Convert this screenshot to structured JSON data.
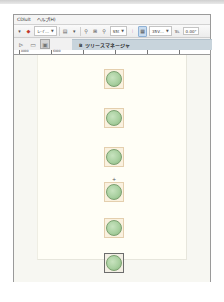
{
  "menubar": {
    "items": [
      {
        "label": "CDlult"
      },
      {
        "label": "ヘルプ(H)"
      }
    ]
  },
  "toolbar": {
    "layer_dropdown": "レイ…",
    "zoom_dropdown": "S5t",
    "size_dropdown": "35V…",
    "value_field": "0.00°"
  },
  "tabstrip": {
    "tab_label": "ツリースマネージャ",
    "tab_icon_glyph": "B"
  },
  "ruler": {
    "ticks": [
      "8000",
      "6000",
      "10000"
    ]
  },
  "canvas": {
    "nodes": [
      {
        "id": "node-1",
        "selected": false
      },
      {
        "id": "node-2",
        "selected": false
      },
      {
        "id": "node-3",
        "selected": false
      },
      {
        "id": "node-4",
        "selected": false
      },
      {
        "id": "node-5",
        "selected": false
      },
      {
        "id": "node-6",
        "selected": true
      }
    ],
    "marker_glyph": "+"
  },
  "colors": {
    "node_fill": "#a9d0a0",
    "node_border": "#e4cfae",
    "page_bg": "#fffef6",
    "tab_bg": "#c8d4dc"
  }
}
